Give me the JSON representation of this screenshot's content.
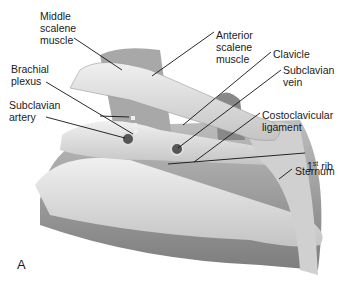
{
  "figure": {
    "panel_letter": "A",
    "labels": [
      {
        "id": "middle-scalene-muscle",
        "text": "Middle\nscalene\nmuscle",
        "x": 40,
        "y": 10
      },
      {
        "id": "anterior-scalene-muscle",
        "text": "Anterior\nscalene\nmuscle",
        "x": 216,
        "y": 29
      },
      {
        "id": "clavicle",
        "text": "Clavicle",
        "x": 273,
        "y": 48
      },
      {
        "id": "brachial-plexus",
        "text": "Brachial\nplexus",
        "x": 11,
        "y": 63
      },
      {
        "id": "subclavian-vein",
        "text": "Subclavian\nvein",
        "x": 283,
        "y": 64
      },
      {
        "id": "subclavian-artery",
        "text": "Subclavian\nartery",
        "x": 9,
        "y": 99
      },
      {
        "id": "costoclavicular-ligament",
        "text": "Costoclavicular\nligament",
        "x": 262,
        "y": 109
      },
      {
        "id": "sternum",
        "text": "Sternum",
        "x": 295,
        "y": 165
      }
    ],
    "first_rib": {
      "base": "1",
      "sup": "st",
      "rest": " rib",
      "x": 307,
      "y": 148
    }
  },
  "colors": {
    "tissue": "#9a9a9a",
    "bone": "#e2e2e2",
    "line": "#111111",
    "text": "#1a1a1a"
  }
}
